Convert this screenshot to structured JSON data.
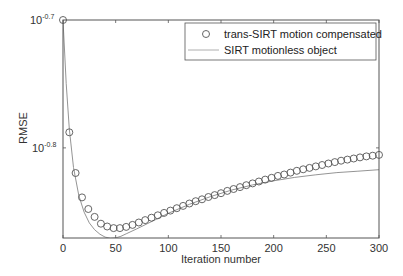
{
  "chart_data": {
    "type": "line",
    "title": "",
    "xlabel": "Iteration number",
    "ylabel": "RMSE",
    "yscale": "log",
    "xlim": [
      0,
      300
    ],
    "ylim": [
      0.1349,
      0.1995
    ],
    "xticks": [
      0,
      50,
      100,
      150,
      200,
      250,
      300
    ],
    "yticks": [
      {
        "value": 0.1995,
        "label_base": "10",
        "label_exp": "-0.7"
      },
      {
        "value": 0.1585,
        "label_base": "10",
        "label_exp": "-0.8"
      }
    ],
    "grid": false,
    "legend_position": "upper right",
    "series": [
      {
        "name": "trans-SIRT motion compensated",
        "style": "circle-markers",
        "x": [
          0,
          6,
          12,
          18,
          24,
          30,
          36,
          42,
          48,
          54,
          60,
          66,
          72,
          78,
          84,
          90,
          96,
          102,
          108,
          114,
          120,
          126,
          132,
          138,
          144,
          150,
          156,
          162,
          168,
          174,
          180,
          186,
          192,
          198,
          204,
          210,
          216,
          222,
          228,
          234,
          240,
          246,
          252,
          258,
          264,
          270,
          276,
          282,
          288,
          294,
          300
        ],
        "values": [
          0.1995,
          0.163,
          0.1515,
          0.145,
          0.142,
          0.14,
          0.1383,
          0.1376,
          0.1372,
          0.1372,
          0.1375,
          0.138,
          0.1386,
          0.1392,
          0.1398,
          0.1404,
          0.141,
          0.1416,
          0.1422,
          0.1428,
          0.1434,
          0.144,
          0.1445,
          0.1451,
          0.1456,
          0.1461,
          0.1467,
          0.1472,
          0.1477,
          0.1482,
          0.1487,
          0.1492,
          0.1497,
          0.1502,
          0.1507,
          0.1511,
          0.1516,
          0.1521,
          0.1525,
          0.1529,
          0.1533,
          0.1537,
          0.1541,
          0.1545,
          0.1549,
          0.1552,
          0.1555,
          0.1558,
          0.1561,
          0.1563,
          0.1565
        ]
      },
      {
        "name": "SIRT motionless object",
        "style": "thin-line",
        "x": [
          0,
          3,
          6,
          10,
          15,
          20,
          25,
          30,
          35,
          40,
          45,
          50,
          55,
          60,
          70,
          80,
          90,
          100,
          120,
          140,
          160,
          180,
          200,
          220,
          240,
          260,
          280,
          300
        ],
        "values": [
          0.1995,
          0.178,
          0.164,
          0.153,
          0.1455,
          0.1412,
          0.1385,
          0.1368,
          0.1357,
          0.135,
          0.1347,
          0.1348,
          0.1352,
          0.1358,
          0.137,
          0.1383,
          0.1396,
          0.1409,
          0.1432,
          0.1452,
          0.1469,
          0.1483,
          0.1494,
          0.1503,
          0.151,
          0.1516,
          0.152,
          0.1524
        ]
      }
    ]
  },
  "legend": {
    "items": [
      {
        "label": "trans-SIRT motion compensated"
      },
      {
        "label": "SIRT motionless object"
      }
    ]
  },
  "axes": {
    "xlabel": "Iteration number",
    "ylabel": "RMSE",
    "xtick_labels": [
      "0",
      "50",
      "100",
      "150",
      "200",
      "250",
      "300"
    ],
    "ytick_top_base": "10",
    "ytick_top_exp": "-0.7",
    "ytick_mid_base": "10",
    "ytick_mid_exp": "-0.8"
  },
  "colors": {
    "axis": "#444444",
    "marker": "#555555",
    "line": "#888888",
    "text": "#333333"
  }
}
